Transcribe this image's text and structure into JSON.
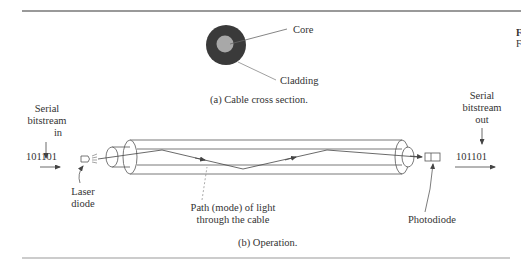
{
  "figure": {
    "cross_section": {
      "labels": {
        "core": "Core",
        "cladding": "Cladding"
      },
      "caption": "(a) Cable cross section.",
      "colors": {
        "cladding": "#3a3a3a",
        "core": "#a8a8a8"
      }
    },
    "operation": {
      "input": {
        "title_line1": "Serial",
        "title_line2": "bitstream",
        "title_line3": "in",
        "bits": "101101"
      },
      "output": {
        "title_line1": "Serial",
        "title_line2": "bitstream",
        "title_line3": "out",
        "bits": "101101"
      },
      "laser_label_line1": "Laser",
      "laser_label_line2": "diode",
      "path_label_line1": "Path (mode) of light",
      "path_label_line2": "through the cable",
      "photodiode_label": "Photodiode",
      "caption": "(b) Operation."
    },
    "side_fragment": {
      "line1": "F",
      "line2": "F"
    },
    "colors": {
      "rule": "#777777",
      "stroke": "#555555",
      "text": "#333333"
    }
  }
}
